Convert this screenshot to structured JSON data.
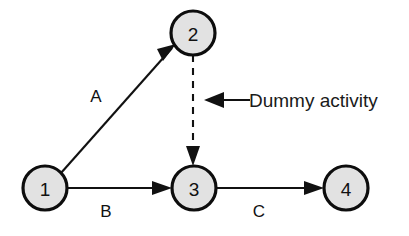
{
  "diagram": {
    "type": "network-diagram",
    "background_color": "#ffffff",
    "node_fill_color": "#e2e2e2",
    "node_stroke_color": "#0d0d0d",
    "line_color": "#111111",
    "nodes": [
      {
        "id": "node-1",
        "label": "1",
        "cx": 45,
        "cy": 188,
        "r": 22
      },
      {
        "id": "node-2",
        "label": "2",
        "cx": 193,
        "cy": 33,
        "r": 22
      },
      {
        "id": "node-3",
        "label": "3",
        "cx": 194,
        "cy": 188,
        "r": 22
      },
      {
        "id": "node-4",
        "label": "4",
        "cx": 346,
        "cy": 188,
        "r": 22
      }
    ],
    "edges": [
      {
        "id": "edge-a",
        "label": "A",
        "from": "node-1",
        "to": "node-2",
        "style": "solid",
        "label_x": 96,
        "label_y": 96
      },
      {
        "id": "edge-b",
        "label": "B",
        "from": "node-1",
        "to": "node-3",
        "style": "solid",
        "label_x": 106,
        "label_y": 211
      },
      {
        "id": "edge-c",
        "label": "C",
        "from": "node-3",
        "to": "node-4",
        "style": "solid",
        "label_x": 259,
        "label_y": 211
      },
      {
        "id": "edge-dummy",
        "label": "",
        "from": "node-2",
        "to": "node-3",
        "style": "dashed",
        "label_x": 0,
        "label_y": 0
      }
    ],
    "annotation": {
      "text": "Dummy activity",
      "text_x": 249,
      "text_y": 100,
      "pointer_from_x": 250,
      "pointer_to_x": 204,
      "pointer_y": 100
    }
  }
}
